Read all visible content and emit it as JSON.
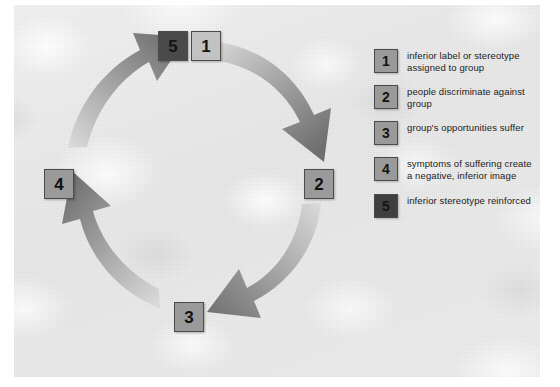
{
  "diagram": {
    "background_color": "#e8e8e8",
    "box_colors": {
      "mid": "#9a9a9a",
      "dark": "#4a4a4a",
      "light": "#c2c2c2",
      "border": "#4b4b4b"
    },
    "arrow_color_dark": "#6e6e6e",
    "arrow_color_light": "#d8d8d8"
  },
  "cycle": {
    "nodes": [
      {
        "id": "5",
        "label": "5",
        "shade": "dark",
        "position": "top-center-left"
      },
      {
        "id": "1",
        "label": "1",
        "shade": "light",
        "position": "top-center-right"
      },
      {
        "id": "2",
        "label": "2",
        "shade": "mid",
        "position": "right"
      },
      {
        "id": "3",
        "label": "3",
        "shade": "mid",
        "position": "bottom"
      },
      {
        "id": "4",
        "label": "4",
        "shade": "mid",
        "position": "left"
      }
    ],
    "arrows": [
      {
        "from": "1",
        "to": "2",
        "name": "arrow-1-to-2",
        "direction": "clockwise"
      },
      {
        "from": "2",
        "to": "3",
        "name": "arrow-2-to-3",
        "direction": "clockwise"
      },
      {
        "from": "3",
        "to": "4",
        "name": "arrow-3-to-4",
        "direction": "clockwise"
      },
      {
        "from": "4",
        "to": "5",
        "name": "arrow-4-to-5",
        "direction": "clockwise"
      }
    ]
  },
  "legend": {
    "items": [
      {
        "number": "1",
        "shade": "mid",
        "text": "inferior label or stereotype assigned to group"
      },
      {
        "number": "2",
        "shade": "mid",
        "text": "people discriminate against group"
      },
      {
        "number": "3",
        "shade": "mid",
        "text": "group's opportunities suffer"
      },
      {
        "number": "4",
        "shade": "mid",
        "text": "symptoms of suffering create a negative, inferior image"
      },
      {
        "number": "5",
        "shade": "dark",
        "text": "inferior stereotype reinforced"
      }
    ]
  }
}
